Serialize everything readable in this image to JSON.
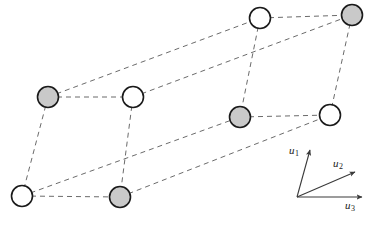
{
  "figure": {
    "width": 379,
    "height": 228,
    "background_color": "#ffffff"
  },
  "style": {
    "line_color": "#6b6b6b",
    "line_width": 1.0,
    "dash_pattern": "5,4",
    "node_stroke_color": "#1a1a1a",
    "node_stroke_width": 1.6,
    "node_radius": 10.5,
    "node_fill_shaded": "#c9c9c9",
    "node_fill_open": "#ffffff",
    "axis_color": "#3a3a3a",
    "axis_width": 1.1,
    "label_color": "#1a1a1a"
  },
  "lattice": {
    "description": "Eight lattice sites at the corners of a sheared parallelepiped, connected by dashed edges",
    "node_count": 8,
    "edge_count": 12,
    "nodes": [
      {
        "id": "n1",
        "name": "back-top-left",
        "x": 260,
        "y": 18,
        "fill": "open",
        "label": ""
      },
      {
        "id": "n2",
        "name": "back-top-right",
        "x": 352,
        "y": 15,
        "fill": "shaded",
        "label": ""
      },
      {
        "id": "n3",
        "name": "back-bottom-left",
        "x": 240,
        "y": 117,
        "fill": "shaded",
        "label": ""
      },
      {
        "id": "n4",
        "name": "back-bottom-right",
        "x": 330,
        "y": 115,
        "fill": "open",
        "label": ""
      },
      {
        "id": "n5",
        "name": "front-top-left",
        "x": 48,
        "y": 97,
        "fill": "shaded",
        "label": ""
      },
      {
        "id": "n6",
        "name": "front-top-right",
        "x": 133,
        "y": 97,
        "fill": "open",
        "label": ""
      },
      {
        "id": "n7",
        "name": "front-bottom-left",
        "x": 22,
        "y": 196,
        "fill": "open",
        "label": ""
      },
      {
        "id": "n8",
        "name": "front-bottom-right",
        "x": 120,
        "y": 197,
        "fill": "shaded",
        "label": ""
      }
    ],
    "edges": [
      {
        "from": "n1",
        "to": "n2",
        "name": "edge-back-top"
      },
      {
        "from": "n3",
        "to": "n4",
        "name": "edge-back-bottom"
      },
      {
        "from": "n1",
        "to": "n3",
        "name": "edge-back-left"
      },
      {
        "from": "n2",
        "to": "n4",
        "name": "edge-back-right"
      },
      {
        "from": "n5",
        "to": "n6",
        "name": "edge-front-top"
      },
      {
        "from": "n7",
        "to": "n8",
        "name": "edge-front-bottom"
      },
      {
        "from": "n5",
        "to": "n7",
        "name": "edge-front-left"
      },
      {
        "from": "n6",
        "to": "n8",
        "name": "edge-front-right"
      },
      {
        "from": "n5",
        "to": "n1",
        "name": "edge-depth-top-left"
      },
      {
        "from": "n6",
        "to": "n2",
        "name": "edge-depth-top-right"
      },
      {
        "from": "n7",
        "to": "n3",
        "name": "edge-depth-bottom-left"
      },
      {
        "from": "n8",
        "to": "n4",
        "name": "edge-depth-bottom-right"
      }
    ]
  },
  "axes": {
    "origin": {
      "x": 297,
      "y": 197
    },
    "vectors": [
      {
        "id": "u1",
        "name": "axis-u1",
        "label_base": "u",
        "label_sub": "1",
        "tip": {
          "x": 310,
          "y": 150
        },
        "label_pos": {
          "x": 289,
          "y": 144
        }
      },
      {
        "id": "u2",
        "name": "axis-u2",
        "label_base": "u",
        "label_sub": "2",
        "tip": {
          "x": 355,
          "y": 172
        },
        "label_pos": {
          "x": 333,
          "y": 157
        }
      },
      {
        "id": "u3",
        "name": "axis-u3",
        "label_base": "u",
        "label_sub": "3",
        "tip": {
          "x": 362,
          "y": 197
        },
        "label_pos": {
          "x": 345,
          "y": 199
        }
      }
    ]
  }
}
